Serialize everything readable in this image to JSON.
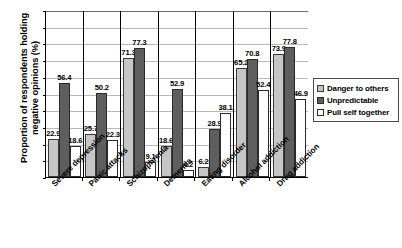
{
  "chart_data": {
    "type": "bar",
    "title": "",
    "xlabel": "",
    "ylabel": "Proportion of respondents holding negative opinions (%)",
    "ylim": [
      0,
      100
    ],
    "ytick_labels": [
      "0",
      "10",
      "20",
      "30",
      "40",
      "50",
      "60",
      "70",
      "80",
      "90",
      "100"
    ],
    "ytick_values": [
      0,
      10,
      20,
      30,
      40,
      50,
      60,
      70,
      80,
      90,
      100
    ],
    "grid": true,
    "legend_position": "right",
    "categories": [
      "Severe depression",
      "Panic attacks",
      "Schizophrenia",
      "Dementia",
      "Eating disorder",
      "Alcohol addiction",
      "Drug addiction"
    ],
    "series": [
      {
        "name": "Danger to others",
        "color": "#c6c6c6",
        "values": [
          22.9,
          25.7,
          71.3,
          18.6,
          6.2,
          65.2,
          73.9
        ]
      },
      {
        "name": "Unpredictable",
        "color": "#5e5e5e",
        "values": [
          56.4,
          50.2,
          77.3,
          52.9,
          28.9,
          70.8,
          77.8
        ]
      },
      {
        "name": "Pull self together",
        "color": "#ffffff",
        "values": [
          18.6,
          22.3,
          9.1,
          4.2,
          38.1,
          52.4,
          46.9
        ]
      }
    ],
    "data_labels": [
      [
        "22.9",
        "56.4",
        "18.6"
      ],
      [
        "25.7",
        "50.2",
        "22.3"
      ],
      [
        "71.3",
        "77.3",
        "9.1"
      ],
      [
        "18.6",
        "52.9",
        "4.2"
      ],
      [
        "6.2",
        "28.9",
        "38.1"
      ],
      [
        "65.2",
        "70.8",
        "52.4"
      ],
      [
        "73.9",
        "77.8",
        "46.9"
      ]
    ]
  },
  "legend": {
    "items": [
      {
        "label": "Danger to others"
      },
      {
        "label": "Unpredictable"
      },
      {
        "label": "Pull self together"
      }
    ]
  }
}
